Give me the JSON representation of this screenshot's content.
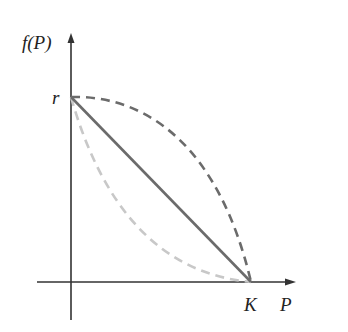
{
  "diagram": {
    "title": "",
    "labels": {
      "y_axis": "f(P)",
      "x_axis": "P",
      "y_intercept": "r",
      "x_intercept": "K"
    },
    "curves": [
      {
        "name": "linear",
        "style": "solid",
        "color": "#6b6b6b",
        "description": "straight line from (0, r) to (K, 0)"
      },
      {
        "name": "concave",
        "style": "dashed",
        "color": "#6b6b6b",
        "description": "concave-down curve from (0, r) to (K, 0), above the line"
      },
      {
        "name": "convex",
        "style": "dashed",
        "color": "#c8c8c8",
        "description": "convex curve from (0, r) to (K, 0), below the line"
      }
    ],
    "colors": {
      "axes": "#333333",
      "dark_curve": "#6b6b6b",
      "light_curve": "#c8c8c8"
    }
  }
}
